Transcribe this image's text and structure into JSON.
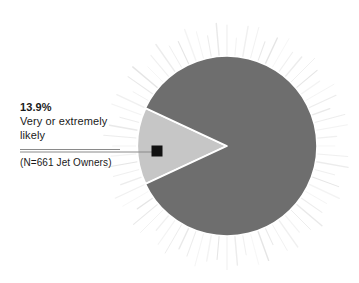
{
  "canvas": {
    "width": 359,
    "height": 283,
    "background": "#ffffff"
  },
  "callout": {
    "percent_label": "13.9%",
    "description_line1": "Very or extremely",
    "description_line2": "likely",
    "base_label": "(N=661 Jet Owners)"
  },
  "chart_data": {
    "type": "pie",
    "title": "",
    "subtitle": "",
    "xlabel": "",
    "ylabel": "",
    "legend_position": "none",
    "grid": false,
    "annotations": [
      "13.9%",
      "Very or extremely likely",
      "(N=661 Jet Owners)"
    ],
    "base_n": 661,
    "base_description": "Jet Owners",
    "categories": [
      "Very or extremely likely",
      "Other"
    ],
    "values": [
      13.9,
      86.1
    ],
    "labels": [
      "13.9%",
      ""
    ],
    "colors": [
      "#c6c6c6",
      "#6e6e6e"
    ],
    "slice_border_color": "#ffffff",
    "highlight_slice_index": 0,
    "start_angle_deg": 155,
    "center": {
      "x": 227,
      "y": 146
    },
    "radius": 90,
    "halo": {
      "style": "radiating-spikes",
      "count": 72,
      "color": "#d9d9d9",
      "inner_radius": 90,
      "outer_radius": 126
    },
    "marker": {
      "shape": "square",
      "color": "#111111",
      "x": 157,
      "y": 151,
      "size": 11
    },
    "leader_line": {
      "color": "#8a8a8a",
      "from_x": 20,
      "to_x": 157,
      "y": 152
    }
  }
}
